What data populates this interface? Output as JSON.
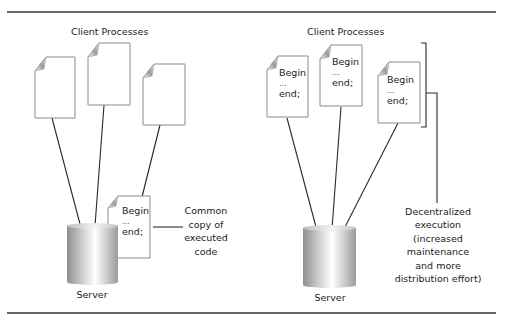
{
  "left_panel": {
    "title": "Client Processes",
    "server_label": "Server",
    "code_doc": {
      "lines": [
        "Begin",
        "...",
        "end;"
      ]
    },
    "annotation": [
      "Common",
      "copy of",
      "executed",
      "code"
    ]
  },
  "right_panel": {
    "title": "Client Processes",
    "server_label": "Server",
    "client_docs": [
      {
        "lines": [
          "Begin",
          "...",
          "end;"
        ]
      },
      {
        "lines": [
          "Begin",
          "...",
          "end;"
        ]
      },
      {
        "lines": [
          "Begin",
          "...",
          "end;"
        ]
      }
    ],
    "annotation": [
      "Decentralized",
      "execution",
      "(increased",
      "maintenance",
      "and more",
      "distribution effort)"
    ]
  },
  "colors": {
    "rule": "#333333",
    "line": "#2a2a2a",
    "doc_border": "#8a8a8a",
    "cylinder_dark": "#8c8c8c",
    "cylinder_light": "#ffffff"
  }
}
